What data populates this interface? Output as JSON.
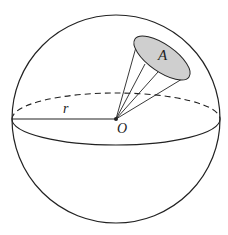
{
  "figure": {
    "type": "sphere-solid-angle-diagram",
    "labels": {
      "area": "A",
      "radius": "r",
      "center": "O"
    },
    "colors": {
      "stroke": "#222222",
      "cap_fill": "#cfcfcf",
      "background": "#ffffff"
    },
    "elements": {
      "sphere": "outer circle",
      "equator_front": "solid lower half of equatorial ellipse",
      "equator_back": "dashed upper half of equatorial ellipse",
      "radius_line": "line from left edge to center O",
      "cone": "lines from O to spherical cap A",
      "cap": "shaded elliptical area A on sphere surface"
    }
  }
}
